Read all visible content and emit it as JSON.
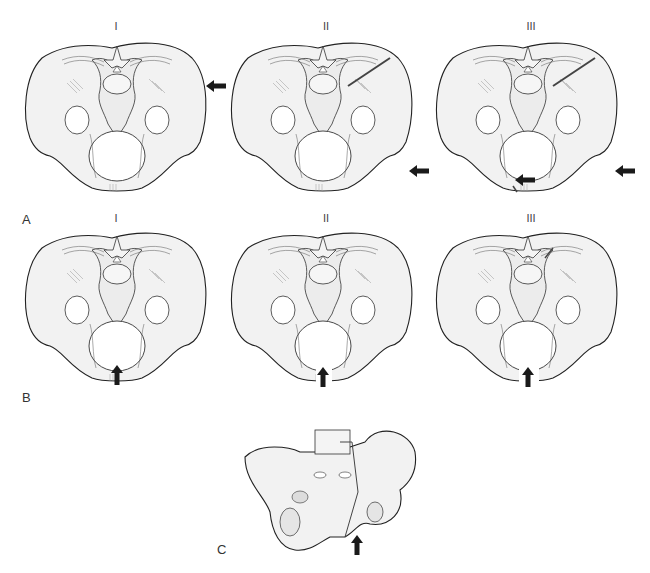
{
  "figure": {
    "panels": [
      {
        "id": "A",
        "label": "A",
        "subfigures": [
          {
            "label": "I",
            "arrow": "lateral"
          },
          {
            "label": "II",
            "arrow": "lateral"
          },
          {
            "label": "III",
            "arrow": "lateral"
          }
        ]
      },
      {
        "id": "B",
        "label": "B",
        "subfigures": [
          {
            "label": "I",
            "arrow": "anterior-posterior"
          },
          {
            "label": "II",
            "arrow": "anterior-posterior"
          },
          {
            "label": "III",
            "arrow": "anterior-posterior"
          }
        ]
      },
      {
        "id": "C",
        "label": "C",
        "subfigures": [
          {
            "label": "",
            "arrow": "vertical"
          }
        ]
      }
    ],
    "colors": {
      "bone_fill": "#f2f2f2",
      "outline": "#222222",
      "arrow": "#1a1a1a"
    }
  }
}
